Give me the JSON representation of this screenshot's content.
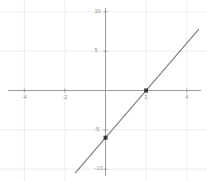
{
  "chart_data": {
    "type": "line",
    "title": "",
    "xlabel": "",
    "ylabel": "",
    "xlim": [
      -5.2,
      5.0
    ],
    "ylim": [
      -11.5,
      11.5
    ],
    "grid": true,
    "legend": "none",
    "equation": "y = 3x - 6",
    "slope": 3,
    "intercept": -6,
    "x": [
      -1.5,
      4.6
    ],
    "y": [
      -10.5,
      7.8
    ],
    "series": [
      {
        "name": "line",
        "color": "#7a7a7a",
        "x": [
          -1.5,
          4.6
        ],
        "y": [
          -10.5,
          7.8
        ]
      }
    ],
    "points": [
      {
        "label": "y-intercept",
        "x": 0,
        "y": -6
      },
      {
        "label": "x-intercept",
        "x": 2,
        "y": 0
      }
    ],
    "point_color": "#3a3a3a",
    "axis_color": "#9a9a9a",
    "grid_color": "#e8e8e8",
    "xticks": [
      -4,
      -2,
      2,
      4
    ],
    "xtick_labels": [
      "-4",
      "-2",
      "2",
      "4"
    ],
    "yticks": [
      10,
      5,
      -5,
      -10
    ],
    "ytick_labels": [
      "10",
      "5",
      "-5",
      "-10"
    ]
  },
  "axes": {
    "x_axis_name": "x-axis",
    "y_axis_name": "y-axis"
  }
}
